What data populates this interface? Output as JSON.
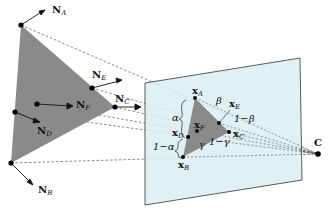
{
  "diagram": {
    "type": "projection-geometry",
    "colors": {
      "triangle_fill": "#8a8a8a",
      "plane_fill": "#d9eef0",
      "plane_stroke": "#333333",
      "ray": "#555555"
    },
    "labels": {
      "NA": {
        "main": "N",
        "sub": "A"
      },
      "NB": {
        "main": "N",
        "sub": "B"
      },
      "NC": {
        "main": "N",
        "sub": "C"
      },
      "ND": {
        "main": "N",
        "sub": "D"
      },
      "NE": {
        "main": "N",
        "sub": "E"
      },
      "NF": {
        "main": "N",
        "sub": "F"
      },
      "xA": {
        "main": "x",
        "sub": "A"
      },
      "xB": {
        "main": "x",
        "sub": "B"
      },
      "xC": {
        "main": "x",
        "sub": "C"
      },
      "xD": {
        "main": "x",
        "sub": "D"
      },
      "xE": {
        "main": "x",
        "sub": "E"
      },
      "xF": {
        "main": "x",
        "sub": "F"
      },
      "C": "C",
      "alpha": "α",
      "one_minus_alpha": "1−α",
      "beta": "β",
      "one_minus_beta": "1−β",
      "gamma": "γ",
      "one_minus_gamma": "1−γ"
    }
  }
}
